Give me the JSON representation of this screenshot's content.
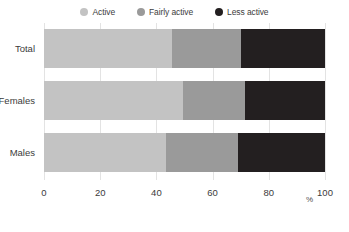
{
  "chart_data": {
    "type": "bar",
    "orientation": "horizontal",
    "stacked": true,
    "normalized_percent": true,
    "title": "",
    "subtitle": "",
    "xlabel": "%",
    "ylabel": "",
    "xlim": [
      0,
      100
    ],
    "xticks": [
      0,
      20,
      40,
      60,
      80,
      100
    ],
    "xticklabels": [
      "0",
      "20",
      "40",
      "60",
      "80",
      "100"
    ],
    "grid": true,
    "grid_axis": "x",
    "legend_position": "top-center",
    "categories": [
      "Total",
      "Females",
      "Males"
    ],
    "series": [
      {
        "name": "Active",
        "color": "#c3c3c3",
        "values": [
          45.5,
          49.5,
          43.5
        ]
      },
      {
        "name": "Fairly active",
        "color": "#9a9a9a",
        "values": [
          24.5,
          22.0,
          25.5
        ]
      },
      {
        "name": "Less active",
        "color": "#231f20",
        "values": [
          30.0,
          28.5,
          31.0
        ]
      }
    ]
  },
  "legend": {
    "items": [
      {
        "label": "Active",
        "color": "#c3c3c3"
      },
      {
        "label": "Fairly active",
        "color": "#9a9a9a"
      },
      {
        "label": "Less active",
        "color": "#231f20"
      }
    ]
  },
  "axes": {
    "y_labels": [
      "Total",
      "Females",
      "Males"
    ],
    "x_tick_labels": [
      "0",
      "20",
      "40",
      "60",
      "80",
      "100"
    ],
    "x_unit_label": "%"
  },
  "colors": {
    "active": "#c3c3c3",
    "fairly_active": "#9a9a9a",
    "less_active": "#231f20",
    "gridline": "#e3e3e3",
    "background": "#ffffff",
    "text": "#3b3b3b"
  }
}
